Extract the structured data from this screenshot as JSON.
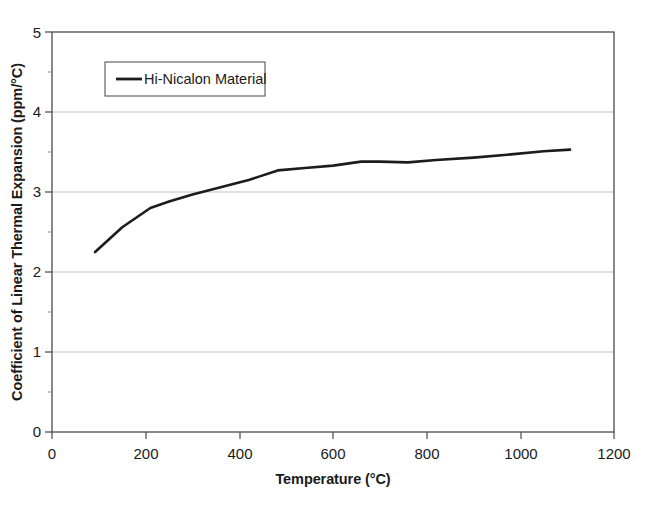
{
  "chart_data": {
    "type": "line",
    "title": "",
    "xlabel": "Temperature (°C)",
    "ylabel": "Coefficient of Linear Thermal Expansion (ppm/°C)",
    "xlim": [
      0,
      1200
    ],
    "ylim": [
      0,
      5
    ],
    "xticks": [
      0,
      200,
      400,
      600,
      800,
      1000,
      1200
    ],
    "yticks": [
      0,
      1,
      2,
      3,
      4,
      5
    ],
    "xtick_labels": [
      "0",
      "200",
      "400",
      "600",
      "800",
      "1000",
      "1200"
    ],
    "ytick_labels": [
      "0",
      "1",
      "2",
      "3",
      "4",
      "5"
    ],
    "y_minor_ticks": [
      0.5,
      1.5,
      2.5,
      3.5,
      4.5
    ],
    "grid": "horizontal-major",
    "legend_position": "upper-left-inside",
    "series": [
      {
        "name": "Hi-Nicalon Material",
        "color": "#1c1c1c",
        "x": [
          92,
          150,
          210,
          250,
          300,
          360,
          420,
          482,
          540,
          600,
          660,
          700,
          760,
          820,
          900,
          980,
          1050,
          1106
        ],
        "y": [
          2.25,
          2.56,
          2.8,
          2.88,
          2.97,
          3.06,
          3.15,
          3.27,
          3.3,
          3.33,
          3.38,
          3.38,
          3.37,
          3.4,
          3.43,
          3.47,
          3.51,
          3.53
        ]
      }
    ]
  },
  "legend": {
    "entries": [
      {
        "label": "Hi-Nicalon Material"
      }
    ]
  }
}
